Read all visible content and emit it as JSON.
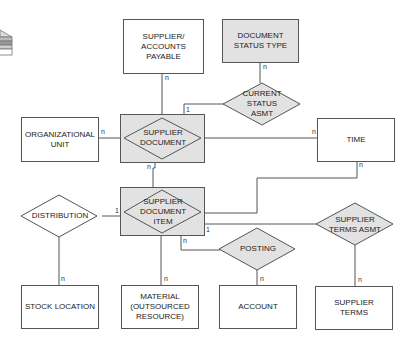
{
  "diagram": {
    "type": "entity-relationship",
    "entities": [
      {
        "id": "supplier_ap",
        "label": "SUPPLIER/ ACCOUNTS PAYABLE",
        "lines": [
          "SUPPLIER/",
          "ACCOUNTS",
          "PAYABLE"
        ],
        "shaded": false
      },
      {
        "id": "doc_status_type",
        "label": "DOCUMENT STATUS TYPE",
        "lines": [
          "DOCUMENT",
          "STATUS TYPE"
        ],
        "shaded": true
      },
      {
        "id": "org_unit",
        "label": "ORGANIZATIONAL UNIT",
        "lines": [
          "ORGANIZATIONAL",
          "UNIT"
        ],
        "shaded": false
      },
      {
        "id": "time",
        "label": "TIME",
        "lines": [
          "TIME"
        ],
        "shaded": false
      },
      {
        "id": "stock_location",
        "label": "STOCK LOCATION",
        "lines": [
          "STOCK LOCATION"
        ],
        "shaded": false
      },
      {
        "id": "material",
        "label": "MATERIAL (OUTSOURCED RESOURCE)",
        "lines": [
          "MATERIAL",
          "(OUTSOURCED",
          "RESOURCE)"
        ],
        "shaded": false
      },
      {
        "id": "account",
        "label": "ACCOUNT",
        "lines": [
          "ACCOUNT"
        ],
        "shaded": false
      },
      {
        "id": "supplier_terms",
        "label": "SUPPLIER TERMS",
        "lines": [
          "SUPPLIER",
          "TERMS"
        ],
        "shaded": false
      }
    ],
    "associative_entities": [
      {
        "id": "supplier_document",
        "label": "SUPPLIER DOCUMENT",
        "lines": [
          "SUPPLIER",
          "DOCUMENT"
        ]
      },
      {
        "id": "supplier_document_item",
        "label": "SUPPLIER DOCUMENT ITEM",
        "lines": [
          "SUPPLIER",
          "DOCUMENT",
          "ITEM"
        ]
      }
    ],
    "relationships": [
      {
        "id": "current_status_asmt",
        "label": "CURRENT STATUS ASMT",
        "lines": [
          "CURRENT",
          "STATUS",
          "ASMT"
        ],
        "shaded": true
      },
      {
        "id": "distribution",
        "label": "DISTRIBUTION",
        "lines": [
          "DISTRIBUTION"
        ],
        "shaded": false
      },
      {
        "id": "posting",
        "label": "POSTING",
        "lines": [
          "POSTING"
        ],
        "shaded": true
      },
      {
        "id": "supplier_terms_asmt",
        "label": "SUPPLIER TERMS ASMT",
        "lines": [
          "SUPPLIER",
          "TERMS ASMT"
        ],
        "shaded": true
      }
    ],
    "connections": [
      {
        "from": "supplier_document",
        "to": "supplier_ap",
        "cardinality": "n"
      },
      {
        "from": "supplier_document",
        "to": "current_status_asmt",
        "cardinality": "1"
      },
      {
        "from": "current_status_asmt",
        "to": "doc_status_type",
        "cardinality": "n"
      },
      {
        "from": "supplier_document",
        "to": "org_unit",
        "cardinality": "n"
      },
      {
        "from": "supplier_document",
        "to": "time",
        "cardinality": "n"
      },
      {
        "from": "supplier_document",
        "to": "supplier_document_item",
        "cardinality": "n"
      },
      {
        "from": "supplier_document_item",
        "to": "time",
        "cardinality": "n"
      },
      {
        "from": "supplier_document_item",
        "to": "distribution",
        "cardinality": "1"
      },
      {
        "from": "distribution",
        "to": "stock_location",
        "cardinality": "n"
      },
      {
        "from": "supplier_document_item",
        "to": "material",
        "cardinality": "n"
      },
      {
        "from": "supplier_document_item",
        "to": "posting",
        "cardinality": "n"
      },
      {
        "from": "posting",
        "to": "account",
        "cardinality": "n"
      },
      {
        "from": "supplier_document_item",
        "to": "supplier_terms_asmt",
        "cardinality": "1"
      },
      {
        "from": "supplier_terms_asmt",
        "to": "supplier_terms",
        "cardinality": "n"
      }
    ],
    "cardinality_labels": {
      "sap_n": "n",
      "csa_1": "1",
      "dst_n": "n",
      "org_n": "n",
      "time_n": "n",
      "sd_n": "n",
      "time2_n": "n",
      "dist_1": "1",
      "stock_n": "n",
      "mat_n": "n",
      "post_n": "n",
      "acct_n": "n",
      "sta_1": "1",
      "st_n": "n"
    },
    "colors": {
      "shade": "#e2e2e2",
      "stroke": "#555555",
      "text": "#222222"
    },
    "legend_icon": "database-stack-icon"
  }
}
